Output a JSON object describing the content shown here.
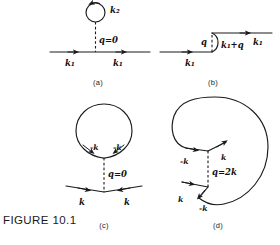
{
  "figure": {
    "caption": "FIGURE 10.1",
    "panels": [
      {
        "key": "a",
        "sublabel": "(a)",
        "labels": {
          "loop_momentum": "k₂",
          "exchange": "q=0",
          "in_line": "k₁",
          "out_line": "k₁"
        }
      },
      {
        "key": "b",
        "sublabel": "(b)",
        "labels": {
          "exchange": "q",
          "in_line": "k₁",
          "loop_line": "k₁+q",
          "out_line": "k₁"
        }
      },
      {
        "key": "c",
        "sublabel": "(c)",
        "labels": {
          "loop_left": "-k",
          "loop_right": "-k",
          "exchange": "q=0",
          "in_line": "k",
          "out_line": "k"
        }
      },
      {
        "key": "d",
        "sublabel": "(d)",
        "labels": {
          "upper_left": "-k",
          "upper_right": "k",
          "exchange": "q=2k",
          "lower_left": "k",
          "lower_right": "-k"
        }
      }
    ]
  },
  "style": {
    "ink": "#1a1a1a",
    "paper": "#ffffff"
  }
}
